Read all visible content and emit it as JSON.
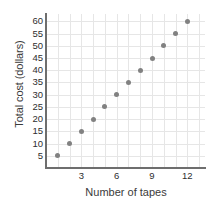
{
  "chart_data": {
    "type": "scatter",
    "title": "",
    "xlabel": "Number of tapes",
    "ylabel": "Total cost (dollars)",
    "x": [
      1,
      2,
      3,
      4,
      5,
      6,
      7,
      8,
      9,
      10,
      11,
      12
    ],
    "values": [
      5,
      10,
      15,
      20,
      25,
      30,
      35,
      40,
      45,
      50,
      55,
      60
    ],
    "points": [
      {
        "x": 1,
        "y": 5
      },
      {
        "x": 2,
        "y": 10
      },
      {
        "x": 3,
        "y": 15
      },
      {
        "x": 4,
        "y": 20
      },
      {
        "x": 5,
        "y": 25
      },
      {
        "x": 6,
        "y": 30
      },
      {
        "x": 7,
        "y": 35
      },
      {
        "x": 8,
        "y": 40
      },
      {
        "x": 9,
        "y": 45
      },
      {
        "x": 10,
        "y": 50
      },
      {
        "x": 11,
        "y": 55
      },
      {
        "x": 12,
        "y": 60
      }
    ],
    "xlim": [
      0,
      13.5
    ],
    "ylim": [
      0,
      63
    ],
    "xticks": [
      3,
      6,
      9,
      12
    ],
    "yticks": [
      5,
      10,
      15,
      20,
      25,
      30,
      35,
      40,
      45,
      50,
      55,
      60
    ],
    "xtick_labels": [
      "3",
      "6",
      "9",
      "12"
    ],
    "ytick_labels": [
      "5",
      "10",
      "15",
      "20",
      "25",
      "30",
      "35",
      "40",
      "45",
      "50",
      "55",
      "60"
    ],
    "grid": true,
    "grid_color": "#e6e6e6",
    "legend": null,
    "marker_color": "#818181",
    "axis_color": "#6e6e6e",
    "background": "#ffffff"
  }
}
